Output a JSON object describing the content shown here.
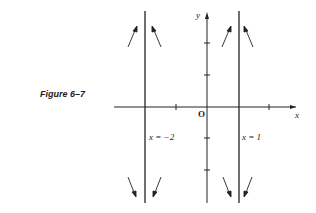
{
  "caption": "Figure 6–7",
  "axes": {
    "x_label": "x",
    "y_label": "y",
    "origin_label": "O"
  },
  "asymptotes": [
    {
      "label": "x = −2",
      "x": -2
    },
    {
      "label": "x = 1",
      "x": 1
    }
  ],
  "colors": {
    "ink": "#222222",
    "background": "#ffffff"
  }
}
